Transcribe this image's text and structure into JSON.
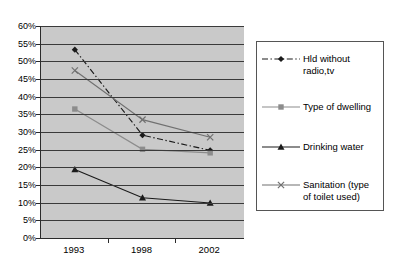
{
  "chart_data": {
    "type": "line",
    "title": "",
    "subtitle": "",
    "xlabel": "",
    "ylabel": "",
    "categories": [
      "1993",
      "1998",
      "2002"
    ],
    "ylim": [
      0,
      60
    ],
    "ytick_step": 5,
    "ytick_labels": [
      "60%",
      "55%",
      "50%",
      "45%",
      "40%",
      "35%",
      "30%",
      "25%",
      "20%",
      "15%",
      "10%",
      "5%",
      "0%"
    ],
    "ytick_values": [
      60,
      55,
      50,
      45,
      40,
      35,
      30,
      25,
      20,
      15,
      10,
      5,
      0
    ],
    "grid": true,
    "grid_axis": "y",
    "legend_position": "right",
    "plot_background": "#c9c9c9",
    "series": [
      {
        "name": "Hld without radio,tv",
        "values": [
          53.3,
          29.1,
          24.8
        ],
        "color": "#1a1a1a",
        "line_style": "dash-dot",
        "marker": "diamond"
      },
      {
        "name": "Type of dwelling",
        "values": [
          36.5,
          25.1,
          24.1
        ],
        "color": "#8c8c8c",
        "line_style": "solid",
        "marker": "square"
      },
      {
        "name": "Drinking water",
        "values": [
          19.4,
          11.4,
          9.9
        ],
        "color": "#1a1a1a",
        "line_style": "solid",
        "marker": "triangle"
      },
      {
        "name": "Sanitation (type of toilet used)",
        "values": [
          47.4,
          33.5,
          28.5
        ],
        "color": "#707070",
        "line_style": "solid",
        "marker": "cross"
      }
    ]
  },
  "legend": {
    "entries": [
      {
        "label_line1": "Hld without",
        "label_line2": "radio,tv"
      },
      {
        "label_line1": "Type of dwelling",
        "label_line2": ""
      },
      {
        "label_line1": "Drinking water",
        "label_line2": ""
      },
      {
        "label_line1": "Sanitation (type",
        "label_line2": "of toilet used)"
      }
    ]
  }
}
